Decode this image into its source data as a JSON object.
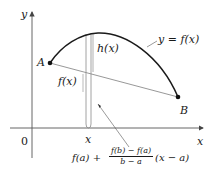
{
  "diagram": {
    "type": "function-graph",
    "axes": {
      "x_label": "x",
      "y_label": "y",
      "origin_label": "0"
    },
    "points": {
      "A": {
        "label": "A"
      },
      "B": {
        "label": "B"
      }
    },
    "labels": {
      "curve": "y = f(x)",
      "h": "h(x)",
      "fx": "f(x)",
      "x_tick": "x"
    },
    "formula": {
      "prefix": "f(a) +",
      "numerator": "f(b) − f(a)",
      "denominator": "b − a",
      "suffix": "(x − a)"
    },
    "colors": {
      "curve": "#1a1a1a",
      "secant": "#8c8c8c",
      "axes": "#555555",
      "strip": "#8c8c8c",
      "points": "#111111"
    }
  }
}
